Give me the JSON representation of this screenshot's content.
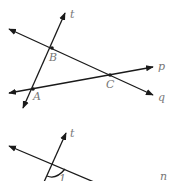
{
  "figure1": {
    "lines": [
      {
        "name": "t",
        "label": "t"
      },
      {
        "name": "q",
        "label": "q"
      },
      {
        "name": "p",
        "label": "p"
      }
    ],
    "points": [
      {
        "name": "A",
        "label": "A"
      },
      {
        "name": "B",
        "label": "B"
      },
      {
        "name": "C",
        "label": "C"
      }
    ]
  },
  "figure2": {
    "lines": [
      {
        "name": "t",
        "label": "t"
      },
      {
        "name": "n",
        "label": "n"
      }
    ],
    "angle_label": "1"
  },
  "colors": {
    "line": "#1a1a1a",
    "label": "#777777",
    "background": "#ffffff"
  }
}
